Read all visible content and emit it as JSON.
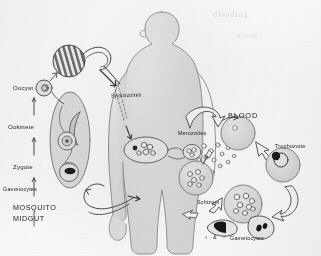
{
  "figure": {
    "background_color": "#fdfdfc",
    "ink_color": "#3a3a3a",
    "fill_gray": "#dcdcdc",
    "fill_gray_light": "#ebebeb"
  },
  "labels": {
    "oocyst": "Oocyst",
    "ookinete": "Ookinete",
    "zygote": "Zygote",
    "gametocytes_mosquito": "Gametocytes",
    "mosquito_line1": "MOSQUITO",
    "mosquito_line2": "MIDGUT",
    "sporozoites": "Sporozoites",
    "blood": "BLOOD",
    "merozoites": "Merozoites",
    "trophozoite": "Trophozoite",
    "schizont": "Schizont",
    "gametocytes_blood": "Gametocytes",
    "female_symbol": "♀",
    "male_symbol": "♂",
    "ampersand": "&"
  },
  "bleed_through": {
    "line1": "gnibeelb",
    "line2": "doolb"
  },
  "diagram_elements": {
    "human_silhouette": "human body outline, grey fill, facing left",
    "mosquito_midgut_oval": "elongated grey oval containing parasite stages",
    "striped_oocyst": "striped circular oocyst bursting with sporozoites",
    "liver_cell": "hepatocyte containing exo-erythrocytic schizont",
    "red_blood_cells": "grey circles representing erythrocytes",
    "arrows": "open outline arrows indicating cycle direction"
  }
}
